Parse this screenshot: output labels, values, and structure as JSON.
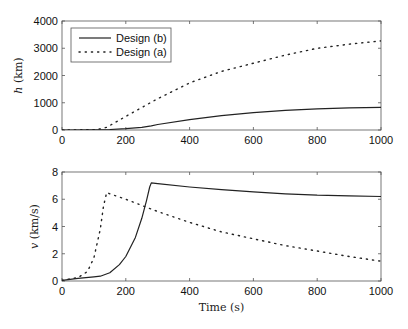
{
  "chart_data": [
    {
      "type": "line",
      "title": "",
      "xlabel": "",
      "ylabel": "h (km)",
      "xlim": [
        0,
        1000
      ],
      "ylim": [
        0,
        4000
      ],
      "xticks": [
        0,
        200,
        400,
        600,
        800,
        1000
      ],
      "yticks": [
        0,
        1000,
        2000,
        3000,
        4000
      ],
      "grid": false,
      "legend_position": "upper left",
      "legend": [
        "Design (b)",
        "Design (a)"
      ],
      "series": [
        {
          "name": "Design (b)",
          "style": "solid",
          "x": [
            0,
            100,
            150,
            200,
            250,
            280,
            300,
            400,
            500,
            600,
            700,
            800,
            900,
            1000
          ],
          "y": [
            0,
            5,
            20,
            50,
            100,
            150,
            200,
            380,
            530,
            640,
            720,
            775,
            810,
            830
          ]
        },
        {
          "name": "Design (a)",
          "style": "dotted",
          "x": [
            0,
            100,
            120,
            140,
            200,
            300,
            400,
            500,
            600,
            700,
            800,
            900,
            1000
          ],
          "y": [
            0,
            10,
            40,
            100,
            500,
            1150,
            1730,
            2150,
            2450,
            2750,
            3000,
            3150,
            3270
          ]
        }
      ]
    },
    {
      "type": "line",
      "title": "",
      "xlabel": "Time (s)",
      "ylabel": "v (km/s)",
      "xlim": [
        0,
        1000
      ],
      "ylim": [
        0,
        8
      ],
      "xticks": [
        0,
        200,
        400,
        600,
        800,
        1000
      ],
      "yticks": [
        0,
        2,
        4,
        6,
        8
      ],
      "grid": false,
      "series": [
        {
          "name": "Design (b)",
          "style": "solid",
          "x": [
            0,
            50,
            100,
            120,
            150,
            180,
            200,
            230,
            250,
            265,
            275,
            280,
            300,
            400,
            500,
            600,
            700,
            800,
            900,
            1000
          ],
          "y": [
            0.05,
            0.2,
            0.3,
            0.35,
            0.6,
            1.2,
            1.8,
            3.2,
            4.6,
            5.9,
            6.9,
            7.2,
            7.15,
            6.9,
            6.7,
            6.55,
            6.4,
            6.3,
            6.25,
            6.2
          ]
        },
        {
          "name": "Design (a)",
          "style": "dotted",
          "x": [
            0,
            50,
            80,
            100,
            120,
            130,
            140,
            150,
            200,
            300,
            400,
            500,
            600,
            700,
            800,
            900,
            1000
          ],
          "y": [
            0.05,
            0.25,
            0.7,
            1.7,
            3.8,
            5.5,
            6.5,
            6.4,
            6.0,
            5.1,
            4.3,
            3.6,
            3.1,
            2.6,
            2.2,
            1.8,
            1.45
          ]
        }
      ]
    }
  ]
}
